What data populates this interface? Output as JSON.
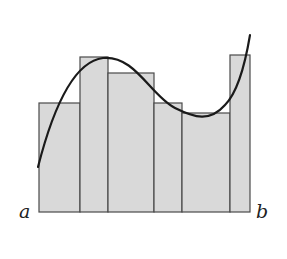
{
  "diagram": {
    "type": "riemann-sum-illustration",
    "labels": {
      "left": "a",
      "right": "b"
    },
    "colors": {
      "bar_fill": "#d9d9d9",
      "bar_stroke": "#4a4a4a",
      "curve": "#1a1a1a",
      "background": "#ffffff"
    },
    "baseline_y": 212,
    "bars": [
      {
        "x0": 39,
        "x1": 80,
        "top": 103
      },
      {
        "x0": 80,
        "x1": 108,
        "top": 57
      },
      {
        "x0": 108,
        "x1": 154,
        "top": 73
      },
      {
        "x0": 154,
        "x1": 182,
        "top": 103
      },
      {
        "x0": 182,
        "x1": 230,
        "top": 113
      },
      {
        "x0": 230,
        "x1": 250,
        "top": 55
      }
    ],
    "curve_path": "M 38 167 C 50 120, 70 62, 103 58 C 135 55, 150 95, 175 108 C 195 118, 210 122, 225 105 C 238 92, 245 65, 250 35"
  }
}
